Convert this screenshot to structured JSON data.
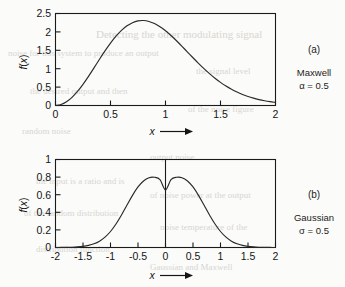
{
  "page": {
    "background_color": "#fbfbf9",
    "ink_color": "#1a1a1a",
    "bleed_through_text": [
      {
        "text": "Detecting the other modulating signal",
        "x": 96,
        "y": 28,
        "size": 11
      },
      {
        "text": "noise for this system to produce an output",
        "x": 8,
        "y": 48,
        "size": 9
      },
      {
        "text": "the signal level",
        "x": 196,
        "y": 66,
        "size": 9
      },
      {
        "text": "the desired output and then",
        "x": 30,
        "y": 86,
        "size": 9
      },
      {
        "text": "of the noise figure",
        "x": 188,
        "y": 104,
        "size": 9
      },
      {
        "text": "random noise",
        "x": 22,
        "y": 126,
        "size": 9
      },
      {
        "text": "output noise",
        "x": 150,
        "y": 152,
        "size": 9
      },
      {
        "text": "the input is a ratio and is",
        "x": 36,
        "y": 176,
        "size": 9
      },
      {
        "text": "of noise power at the output",
        "x": 150,
        "y": 190,
        "size": 9
      },
      {
        "text": "of the random distribution",
        "x": 24,
        "y": 208,
        "size": 9
      },
      {
        "text": "noise temperature of the",
        "x": 160,
        "y": 222,
        "size": 9
      },
      {
        "text": "distribution function",
        "x": 36,
        "y": 244,
        "size": 9
      },
      {
        "text": "Gaussian and Maxwell",
        "x": 150,
        "y": 262,
        "size": 9
      }
    ]
  },
  "chart_data": [
    {
      "id": "maxwell",
      "type": "line",
      "title": "",
      "tag": "(a)",
      "name": "Maxwell",
      "param_label": "α = 0.5",
      "xlabel": "x",
      "ylabel": "f(x)",
      "xlim": [
        0,
        2
      ],
      "ylim": [
        0,
        2.5
      ],
      "xticks": [
        0,
        0.5,
        1,
        1.5,
        2
      ],
      "xticklabels": [
        "0",
        "0.5",
        "1",
        "1.5",
        "2"
      ],
      "yticks": [
        0,
        0.5,
        1,
        1.5,
        2,
        2.5
      ],
      "yticklabels": [
        "0",
        "0.5",
        "1",
        "1.5",
        "2",
        "2.5"
      ],
      "grid": false,
      "legend": "none",
      "peak_x": 0.707,
      "peak_y": 2.31,
      "x": [
        0.0,
        0.05,
        0.1,
        0.15,
        0.2,
        0.25,
        0.3,
        0.35,
        0.4,
        0.45,
        0.5,
        0.55,
        0.6,
        0.65,
        0.7,
        0.75,
        0.8,
        0.85,
        0.9,
        0.95,
        1.0,
        1.05,
        1.1,
        1.15,
        1.2,
        1.25,
        1.3,
        1.35,
        1.4,
        1.45,
        1.5,
        1.55,
        1.6,
        1.65,
        1.7,
        1.75,
        1.8,
        1.85,
        1.9,
        1.95,
        2.0
      ],
      "y": [
        0.0,
        0.0159,
        0.0626,
        0.1374,
        0.2369,
        0.3564,
        0.4903,
        0.6325,
        0.7767,
        0.9169,
        1.0476,
        1.1638,
        1.2617,
        1.3383,
        1.3919,
        1.4217,
        1.4282,
        1.4125,
        1.3767,
        1.3233,
        1.2552,
        1.1756,
        1.0875,
        0.9941,
        0.8982,
        0.8023,
        0.7087,
        0.6193,
        0.5354,
        0.4583,
        0.3885,
        0.3264,
        0.2721,
        0.2251,
        0.1851,
        0.1513,
        0.1231,
        0.0997,
        0.0805,
        0.0648,
        0.0521
      ],
      "y_scale_note": "curve plotted scaled so peak reaches 2.31"
    },
    {
      "id": "gaussian",
      "type": "line",
      "title": "",
      "tag": "(b)",
      "name": "Gaussian",
      "param_label": "σ = 0.5",
      "xlabel": "x",
      "ylabel": "f(x)",
      "xlim": [
        -2,
        2
      ],
      "ylim": [
        0,
        1
      ],
      "xticks": [
        -2,
        -1.5,
        -1,
        -0.5,
        0,
        0.5,
        1,
        1.5,
        2
      ],
      "xticklabels": [
        "-2",
        "-1.5",
        "-1",
        "-0.5",
        "0",
        "0.5",
        "1",
        "1.5",
        "2"
      ],
      "yticks": [
        0,
        0.2,
        0.4,
        0.6,
        0.8,
        1
      ],
      "yticklabels": [
        "0",
        "0.2",
        "0.4",
        "0.6",
        "0.8",
        "1"
      ],
      "grid": false,
      "legend": "none",
      "center_line_x": 0,
      "peak_x": 0,
      "peak_y": 0.7979,
      "x": [
        -2.0,
        -1.9,
        -1.8,
        -1.7,
        -1.6,
        -1.5,
        -1.4,
        -1.3,
        -1.2,
        -1.1,
        -1.0,
        -0.9,
        -0.8,
        -0.7,
        -0.6,
        -0.5,
        -0.4,
        -0.3,
        -0.2,
        -0.1,
        0.0,
        0.1,
        0.2,
        0.3,
        0.4,
        0.5,
        0.6,
        0.7,
        0.8,
        0.9,
        1.0,
        1.1,
        1.2,
        1.3,
        1.4,
        1.5,
        1.6,
        1.7,
        1.8,
        1.9,
        2.0
      ],
      "y": [
        0.0003,
        0.0008,
        0.0018,
        0.0039,
        0.0079,
        0.0155,
        0.029,
        0.0517,
        0.0882,
        0.1435,
        0.2218,
        0.3251,
        0.4505,
        0.5882,
        0.7232,
        0.8394,
        0.9227,
        0.968,
        0.9735,
        0.9401,
        0.7979,
        0.9401,
        0.9735,
        0.968,
        0.9227,
        0.8394,
        0.7232,
        0.5882,
        0.4505,
        0.3251,
        0.2218,
        0.1435,
        0.0882,
        0.0517,
        0.029,
        0.0155,
        0.0079,
        0.0039,
        0.0018,
        0.0008,
        0.0003
      ],
      "y_formula_note": "f(x) = (1/(sigma*sqrt(2*pi))) * exp(-x^2/(2*sigma^2)), sigma=0.5, peak 0.798"
    }
  ]
}
